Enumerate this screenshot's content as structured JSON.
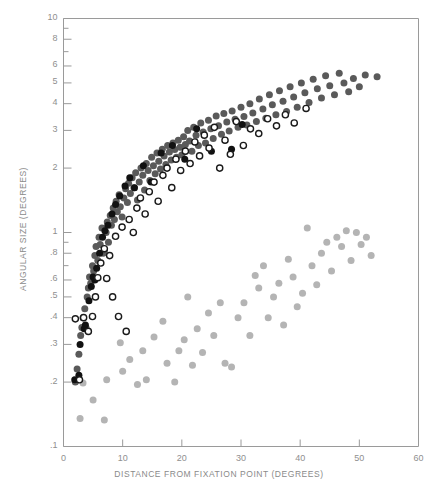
{
  "chart_data": {
    "type": "scatter",
    "title": "",
    "xlabel": "DISTANCE FROM FIXATION POINT (DEGREES)",
    "ylabel": "ANGULAR SIZE (DEGREES)",
    "xscale": "linear",
    "yscale": "log",
    "xlim": [
      0,
      60
    ],
    "ylim": [
      0.1,
      10
    ],
    "grid": false,
    "legend": "none",
    "xticks": [
      0,
      10,
      20,
      30,
      40,
      50,
      60
    ],
    "xtick_labels": [
      "0",
      "10",
      "20",
      "30",
      "40",
      "50",
      "60"
    ],
    "yticks": [
      0.1,
      0.2,
      0.3,
      0.4,
      0.5,
      0.6,
      0.8,
      1,
      2,
      3,
      4,
      5,
      6,
      8,
      10
    ],
    "ytick_labels": [
      ".1",
      ".2",
      ".3",
      ".4",
      ".5",
      ".6",
      ".8",
      "1",
      "2",
      "3",
      "4",
      "5",
      "6",
      "8",
      "10"
    ],
    "colors": {
      "dark_gray_filled": "#5a5a5a",
      "black_filled": "#111111",
      "open_circle": "#1a1a1a",
      "light_gray_filled": "#b4b4b4",
      "axis": "#9a9a9a",
      "text": "#8c8c8c",
      "background": "#ffffff"
    },
    "series": [
      {
        "name": "dark-gray-filled",
        "marker": "filled-circle",
        "color": "#5a5a5a",
        "size": 7,
        "points": [
          [
            2.0,
            0.2
          ],
          [
            2.3,
            0.23
          ],
          [
            2.6,
            0.27
          ],
          [
            2.9,
            0.33
          ],
          [
            3.1,
            0.36
          ],
          [
            3.3,
            0.4
          ],
          [
            3.6,
            0.44
          ],
          [
            3.8,
            0.36
          ],
          [
            4.0,
            0.5
          ],
          [
            4.2,
            0.55
          ],
          [
            4.4,
            0.62
          ],
          [
            4.6,
            0.58
          ],
          [
            4.9,
            0.7
          ],
          [
            5.1,
            0.66
          ],
          [
            5.3,
            0.78
          ],
          [
            5.5,
            0.86
          ],
          [
            5.8,
            0.74
          ],
          [
            6.0,
            0.95
          ],
          [
            6.2,
            0.88
          ],
          [
            6.5,
            1.05
          ],
          [
            6.7,
            0.8
          ],
          [
            6.9,
            0.82
          ],
          [
            7.2,
            1.0
          ],
          [
            7.4,
            1.12
          ],
          [
            7.6,
            0.9
          ],
          [
            7.9,
            1.2
          ],
          [
            8.1,
            1.08
          ],
          [
            8.4,
            1.3
          ],
          [
            8.6,
            1.15
          ],
          [
            8.9,
            1.4
          ],
          [
            9.1,
            1.25
          ],
          [
            9.4,
            1.5
          ],
          [
            9.6,
            1.32
          ],
          [
            9.9,
            1.18
          ],
          [
            10.2,
            1.45
          ],
          [
            10.5,
            1.6
          ],
          [
            10.8,
            1.38
          ],
          [
            11.0,
            1.7
          ],
          [
            11.3,
            1.52
          ],
          [
            11.6,
            1.8
          ],
          [
            11.9,
            1.62
          ],
          [
            12.2,
            1.9
          ],
          [
            12.5,
            1.42
          ],
          [
            12.8,
            1.72
          ],
          [
            13.1,
            2.0
          ],
          [
            13.4,
            1.85
          ],
          [
            13.7,
            1.58
          ],
          [
            14.0,
            2.1
          ],
          [
            14.3,
            1.95
          ],
          [
            14.6,
            1.75
          ],
          [
            14.9,
            2.25
          ],
          [
            15.2,
            2.05
          ],
          [
            15.5,
            1.88
          ],
          [
            15.8,
            2.35
          ],
          [
            16.1,
            2.15
          ],
          [
            16.4,
            1.98
          ],
          [
            16.7,
            2.45
          ],
          [
            17.0,
            2.28
          ],
          [
            17.3,
            2.08
          ],
          [
            17.6,
            2.55
          ],
          [
            17.9,
            2.38
          ],
          [
            18.2,
            2.18
          ],
          [
            18.5,
            2.62
          ],
          [
            18.8,
            2.44
          ],
          [
            19.1,
            2.25
          ],
          [
            19.4,
            2.7
          ],
          [
            19.7,
            2.5
          ],
          [
            20.0,
            2.3
          ],
          [
            20.3,
            2.8
          ],
          [
            20.6,
            2.58
          ],
          [
            21.0,
            3.0
          ],
          [
            21.3,
            2.68
          ],
          [
            21.7,
            2.4
          ],
          [
            22.0,
            3.1
          ],
          [
            22.4,
            2.85
          ],
          [
            22.8,
            2.55
          ],
          [
            23.2,
            3.25
          ],
          [
            23.6,
            2.95
          ],
          [
            24.0,
            2.62
          ],
          [
            24.5,
            3.35
          ],
          [
            24.9,
            3.05
          ],
          [
            25.3,
            2.75
          ],
          [
            25.8,
            3.5
          ],
          [
            26.2,
            3.15
          ],
          [
            26.7,
            2.88
          ],
          [
            27.1,
            3.6
          ],
          [
            27.6,
            3.28
          ],
          [
            28.0,
            2.98
          ],
          [
            28.5,
            3.7
          ],
          [
            29.0,
            3.38
          ],
          [
            29.5,
            3.1
          ],
          [
            30.0,
            3.85
          ],
          [
            30.5,
            3.48
          ],
          [
            31.0,
            3.18
          ],
          [
            31.5,
            4.0
          ],
          [
            32.0,
            3.62
          ],
          [
            32.6,
            3.3
          ],
          [
            33.1,
            4.2
          ],
          [
            33.7,
            3.78
          ],
          [
            34.2,
            3.42
          ],
          [
            34.8,
            4.4
          ],
          [
            35.3,
            3.95
          ],
          [
            35.9,
            3.55
          ],
          [
            36.5,
            4.6
          ],
          [
            37.1,
            4.1
          ],
          [
            37.7,
            3.68
          ],
          [
            38.3,
            4.8
          ],
          [
            38.9,
            4.3
          ],
          [
            39.5,
            3.85
          ],
          [
            40.2,
            5.0
          ],
          [
            40.8,
            4.5
          ],
          [
            41.5,
            4.05
          ],
          [
            42.2,
            5.2
          ],
          [
            42.9,
            4.7
          ],
          [
            43.6,
            4.25
          ],
          [
            44.3,
            5.4
          ],
          [
            45.0,
            4.85
          ],
          [
            45.8,
            4.4
          ],
          [
            46.6,
            5.55
          ],
          [
            47.4,
            5.0
          ],
          [
            48.2,
            4.55
          ],
          [
            49.0,
            5.25
          ],
          [
            50.0,
            4.8
          ],
          [
            51.0,
            5.45
          ],
          [
            53.0,
            5.35
          ]
        ]
      },
      {
        "name": "black-filled",
        "marker": "filled-circle",
        "color": "#111111",
        "size": 7,
        "points": [
          [
            1.9,
            0.205
          ],
          [
            2.6,
            0.215
          ],
          [
            2.8,
            0.3
          ],
          [
            3.5,
            0.355
          ],
          [
            3.7,
            0.37
          ],
          [
            4.3,
            0.48
          ],
          [
            4.7,
            0.56
          ],
          [
            5.0,
            0.62
          ],
          [
            5.3,
            0.6
          ],
          [
            5.6,
            0.68
          ],
          [
            6.1,
            0.8
          ],
          [
            6.6,
            0.95
          ],
          [
            7.0,
            1.02
          ],
          [
            7.5,
            1.08
          ],
          [
            8.2,
            1.22
          ],
          [
            8.8,
            1.35
          ],
          [
            9.5,
            1.48
          ],
          [
            10.4,
            1.65
          ],
          [
            11.2,
            1.8
          ],
          [
            12.0,
            1.62
          ],
          [
            13.5,
            2.05
          ],
          [
            14.8,
            1.72
          ],
          [
            16.5,
            2.35
          ],
          [
            18.4,
            2.55
          ],
          [
            20.5,
            2.2
          ],
          [
            22.5,
            3.05
          ],
          [
            25.0,
            2.4
          ],
          [
            28.4,
            2.45
          ],
          [
            30.2,
            3.2
          ]
        ]
      },
      {
        "name": "open-circle",
        "marker": "open-circle",
        "color": "#1a1a1a",
        "size": 7,
        "points": [
          [
            2.0,
            0.395
          ],
          [
            2.7,
            0.205
          ],
          [
            3.4,
            0.4
          ],
          [
            4.2,
            0.345
          ],
          [
            4.9,
            0.405
          ],
          [
            5.4,
            0.5
          ],
          [
            5.8,
            0.615
          ],
          [
            6.3,
            0.72
          ],
          [
            6.9,
            0.84
          ],
          [
            7.3,
            0.61
          ],
          [
            7.8,
            0.78
          ],
          [
            8.3,
            0.5
          ],
          [
            8.8,
            0.96
          ],
          [
            9.3,
            0.405
          ],
          [
            9.9,
            1.06
          ],
          [
            10.6,
            0.345
          ],
          [
            11.1,
            1.15
          ],
          [
            11.8,
            1.0
          ],
          [
            12.4,
            1.3
          ],
          [
            13.0,
            1.45
          ],
          [
            13.8,
            1.22
          ],
          [
            14.5,
            1.55
          ],
          [
            15.3,
            1.72
          ],
          [
            16.0,
            1.4
          ],
          [
            16.8,
            1.85
          ],
          [
            17.5,
            2.0
          ],
          [
            18.3,
            1.62
          ],
          [
            19.0,
            2.2
          ],
          [
            19.8,
            1.95
          ],
          [
            20.6,
            2.4
          ],
          [
            21.4,
            2.1
          ],
          [
            22.2,
            2.65
          ],
          [
            23.0,
            2.28
          ],
          [
            23.8,
            2.85
          ],
          [
            24.6,
            2.48
          ],
          [
            25.5,
            3.1
          ],
          [
            26.4,
            2.0
          ],
          [
            27.3,
            2.7
          ],
          [
            28.2,
            2.32
          ],
          [
            29.2,
            3.3
          ],
          [
            30.4,
            2.55
          ],
          [
            31.6,
            3.05
          ],
          [
            33.0,
            2.9
          ],
          [
            34.5,
            3.4
          ],
          [
            36.0,
            3.15
          ],
          [
            37.5,
            3.55
          ],
          [
            39.0,
            3.25
          ],
          [
            41.0,
            3.8
          ]
        ]
      },
      {
        "name": "light-gray-filled",
        "marker": "filled-circle",
        "color": "#b4b4b4",
        "size": 7,
        "points": [
          [
            2.8,
            0.135
          ],
          [
            6.9,
            0.133
          ],
          [
            3.3,
            0.198
          ],
          [
            5.0,
            0.165
          ],
          [
            7.3,
            0.205
          ],
          [
            9.6,
            0.305
          ],
          [
            10.0,
            0.225
          ],
          [
            11.2,
            0.255
          ],
          [
            12.5,
            0.195
          ],
          [
            13.4,
            0.28
          ],
          [
            14.0,
            0.205
          ],
          [
            15.3,
            0.325
          ],
          [
            16.8,
            0.385
          ],
          [
            17.5,
            0.245
          ],
          [
            18.8,
            0.2
          ],
          [
            19.5,
            0.28
          ],
          [
            20.4,
            0.315
          ],
          [
            21.0,
            0.5
          ],
          [
            21.8,
            0.24
          ],
          [
            22.6,
            0.355
          ],
          [
            23.5,
            0.275
          ],
          [
            24.5,
            0.42
          ],
          [
            25.4,
            0.33
          ],
          [
            26.5,
            0.47
          ],
          [
            27.3,
            0.245
          ],
          [
            28.4,
            0.235
          ],
          [
            29.5,
            0.4
          ],
          [
            30.5,
            0.47
          ],
          [
            31.5,
            0.33
          ],
          [
            32.4,
            0.63
          ],
          [
            33.0,
            0.55
          ],
          [
            33.8,
            0.7
          ],
          [
            34.6,
            0.4
          ],
          [
            35.5,
            0.5
          ],
          [
            36.4,
            0.58
          ],
          [
            37.2,
            0.37
          ],
          [
            38.0,
            0.75
          ],
          [
            38.8,
            0.62
          ],
          [
            39.5,
            0.45
          ],
          [
            40.4,
            0.52
          ],
          [
            41.2,
            1.05
          ],
          [
            42.0,
            0.7
          ],
          [
            42.8,
            0.57
          ],
          [
            43.6,
            0.8
          ],
          [
            44.5,
            0.9
          ],
          [
            45.3,
            0.66
          ],
          [
            46.2,
            0.95
          ],
          [
            47.0,
            0.86
          ],
          [
            47.8,
            1.02
          ],
          [
            48.6,
            0.74
          ],
          [
            49.5,
            1.0
          ],
          [
            50.3,
            0.88
          ],
          [
            51.2,
            0.95
          ],
          [
            52.0,
            0.78
          ]
        ]
      }
    ]
  },
  "figure": {
    "frame_color": "#9a9a9a",
    "axis_label_color": "#8c8c8c"
  }
}
